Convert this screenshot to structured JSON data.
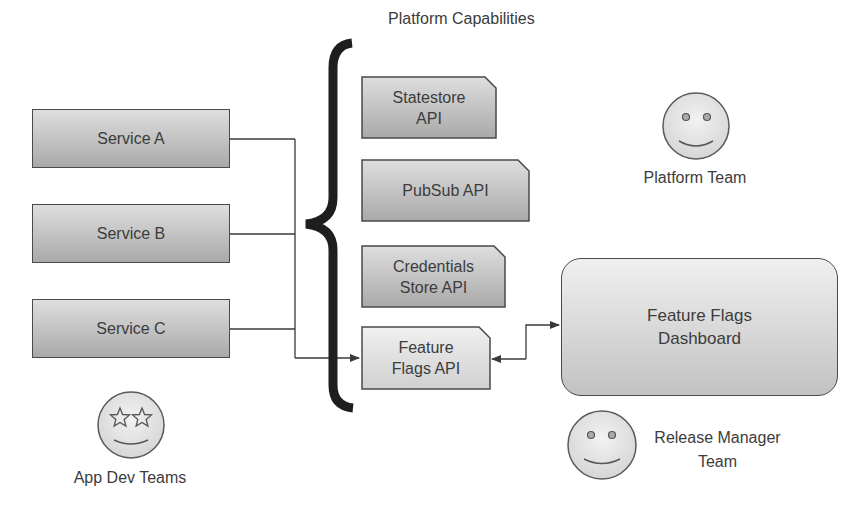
{
  "title": "Platform Capabilities",
  "services": [
    {
      "label": "Service A"
    },
    {
      "label": "Service B"
    },
    {
      "label": "Service C"
    }
  ],
  "capabilities": [
    {
      "label_line1": "Statestore",
      "label_line2": "API"
    },
    {
      "label_line1": "PubSub API",
      "label_line2": ""
    },
    {
      "label_line1": "Credentials",
      "label_line2": "Store API"
    },
    {
      "label_line1": "Feature",
      "label_line2": "Flags API",
      "highlighted": true
    }
  ],
  "dashboard": {
    "label_line1": "Feature Flags",
    "label_line2": "Dashboard"
  },
  "actors": {
    "platform_team": {
      "label": "Platform Team",
      "icon": "smiley-face-icon"
    },
    "release_manager": {
      "label_line1": "Release Manager",
      "label_line2": "Team",
      "icon": "smiley-face-icon"
    },
    "app_dev": {
      "label": "App Dev Teams",
      "icon": "star-eyes-face-icon"
    }
  },
  "colors": {
    "stroke": "#4a4a4a",
    "box_top": "#dedede",
    "box_bottom": "#a9a9a9",
    "brace": "#1e1e1e"
  }
}
